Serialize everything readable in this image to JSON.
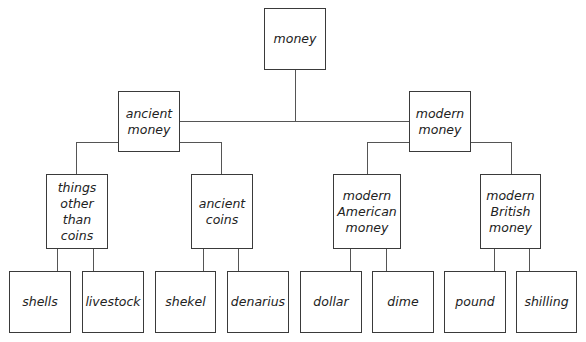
{
  "diagram": {
    "title": "money",
    "nodes": {
      "root": "money",
      "ancient_money": "ancient\nmoney",
      "modern_money": "modern\nmoney",
      "things_other_than_coins": "things\nother\nthan\ncoins",
      "ancient_coins": "ancient\ncoins",
      "modern_american_money": "modern\nAmerican\nmoney",
      "modern_british_money": "modern\nBritish\nmoney",
      "shells": "shells",
      "livestock": "livestock",
      "shekel": "shekel",
      "denarius": "denarius",
      "dollar": "dollar",
      "dime": "dime",
      "pound": "pound",
      "shilling": "shilling"
    },
    "tree": {
      "label": "money",
      "children": [
        {
          "label": "ancient money",
          "children": [
            {
              "label": "things other than coins",
              "children": [
                {
                  "label": "shells"
                },
                {
                  "label": "livestock"
                }
              ]
            },
            {
              "label": "ancient coins",
              "children": [
                {
                  "label": "shekel"
                },
                {
                  "label": "denarius"
                }
              ]
            }
          ]
        },
        {
          "label": "modern money",
          "children": [
            {
              "label": "modern American money",
              "children": [
                {
                  "label": "dollar"
                },
                {
                  "label": "dime"
                }
              ]
            },
            {
              "label": "modern British money",
              "children": [
                {
                  "label": "pound"
                },
                {
                  "label": "shilling"
                }
              ]
            }
          ]
        }
      ]
    },
    "colors": {
      "border": "#3a3a3a",
      "line": "#555555",
      "text": "#222222",
      "background": "#ffffff"
    }
  }
}
